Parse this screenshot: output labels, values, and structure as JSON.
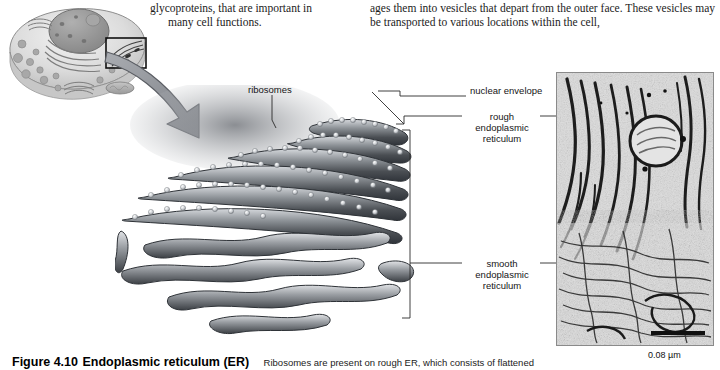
{
  "body_text": {
    "left_column": {
      "line1": "glycoproteins, that are important in",
      "line2": "many cell functions."
    },
    "right_column": {
      "line1": "ages them into vesicles that depart from the outer face. These",
      "line2": "vesicles may be transported to various locations within the cell,"
    }
  },
  "diagram": {
    "labels": {
      "ribosomes": "ribosomes",
      "nuclear_envelope": "nuclear envelope",
      "rough_er": "rough endoplasmic reticulum",
      "smooth_er": "smooth endoplasmic reticulum"
    },
    "overview_alt": "generalized animal cell illustration with inset box on endoplasmic reticulum region",
    "arrow_alt": "curved magnification arrow from inset box to enlarged diagram"
  },
  "micrograph": {
    "alt": "transmission electron micrograph of endoplasmic reticulum membranes",
    "scale_bar_label": "0.08 µm"
  },
  "caption": {
    "figure_number": "Figure 4.10",
    "title": "Endoplasmic reticulum (ER)",
    "body": "Ribosomes are present on rough ER, which consists of flattened"
  },
  "colors": {
    "text": "#1b1b1b",
    "label": "#151515",
    "leader_line": "#2b2b2b",
    "arrow_fill": "#8e9197",
    "arrow_stroke": "#55585e",
    "membrane_dark": "#3f4246",
    "membrane_mid": "#6e7378",
    "membrane_light": "#c9ccd0",
    "ribosome": "#d8dade",
    "inset_box": "#111111",
    "micrograph_bg": "#d2d2d2"
  }
}
